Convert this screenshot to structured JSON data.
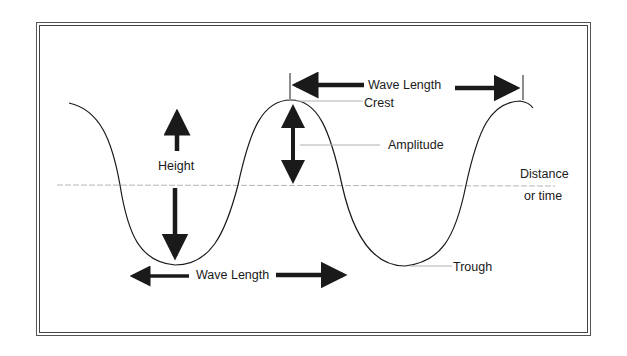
{
  "diagram": {
    "title": "",
    "labels": {
      "wave_length_top": "Wave  Length",
      "crest": "Crest",
      "amplitude": "Amplitude",
      "height": "Height",
      "distance": "Distance",
      "or_time": "or  time",
      "wave_length_bottom": "Wave  Length",
      "trough": "Trough"
    },
    "colors": {
      "stroke": "#1a1a1a",
      "guide": "#aaaaaa",
      "frame": "#555555",
      "background": "#ffffff"
    }
  }
}
